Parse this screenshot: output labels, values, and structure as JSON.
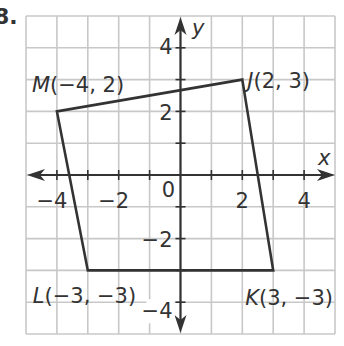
{
  "problem_number": "8.",
  "chart_data": {
    "type": "scatter",
    "title": "",
    "xlabel": "x",
    "ylabel": "y",
    "xlim": [
      -5,
      5
    ],
    "ylim": [
      -5,
      5
    ],
    "grid": true,
    "x_tick_labels": [
      {
        "value": -4,
        "label": "−4"
      },
      {
        "value": -2,
        "label": "−2"
      },
      {
        "value": 0,
        "label": "0"
      },
      {
        "value": 2,
        "label": "2"
      },
      {
        "value": 4,
        "label": "4"
      }
    ],
    "y_tick_labels": [
      {
        "value": 4,
        "label": "4"
      },
      {
        "value": 2,
        "label": "2"
      },
      {
        "value": -2,
        "label": "−2"
      },
      {
        "value": -4,
        "label": "−4"
      }
    ],
    "polygon": {
      "closed": true,
      "vertices": [
        {
          "name": "J",
          "x": 2,
          "y": 3,
          "label": "J(2, 3)"
        },
        {
          "name": "K",
          "x": 3,
          "y": -3,
          "label": "K(3, −3)"
        },
        {
          "name": "L",
          "x": -3,
          "y": -3,
          "label": "L(−3, −3)"
        },
        {
          "name": "M",
          "x": -4,
          "y": 2,
          "label": "M(−4, 2)"
        }
      ]
    },
    "colors": {
      "grid": "#c8c8c8",
      "axes": "#333333",
      "polygon": "#333333",
      "text": "#333333"
    }
  }
}
